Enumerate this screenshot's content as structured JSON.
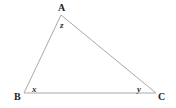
{
  "diagram": {
    "type": "triangle",
    "stroke_color": "#aaaaaa",
    "text_color": "#222222",
    "vertices": [
      {
        "name": "A",
        "label": "A",
        "x": 61,
        "y": 15,
        "label_x": 58,
        "label_y": 11
      },
      {
        "name": "B",
        "label": "B",
        "x": 24,
        "y": 93,
        "label_x": 14,
        "label_y": 100
      },
      {
        "name": "C",
        "label": "C",
        "x": 156,
        "y": 93,
        "label_x": 158,
        "label_y": 100
      }
    ],
    "angles": [
      {
        "vertex": "A",
        "label": "z",
        "x": 60,
        "y": 28
      },
      {
        "vertex": "B",
        "label": "x",
        "x": 32,
        "y": 92
      },
      {
        "vertex": "C",
        "label": "y",
        "x": 137,
        "y": 92
      }
    ],
    "sides": [
      {
        "name": "AB",
        "from": "A",
        "to": "B"
      },
      {
        "name": "BC",
        "from": "B",
        "to": "C"
      },
      {
        "name": "CA",
        "from": "C",
        "to": "A"
      }
    ]
  }
}
